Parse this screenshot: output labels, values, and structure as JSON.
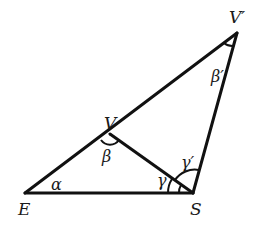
{
  "diagram": {
    "points": {
      "E": {
        "label": "E",
        "x": 25,
        "y": 193
      },
      "S": {
        "label": "S",
        "x": 193,
        "y": 193
      },
      "Vp": {
        "label": "V′",
        "x": 237,
        "y": 33
      },
      "V": {
        "label": "V",
        "x": 110,
        "y": 134
      }
    },
    "angles": {
      "alpha": {
        "label": "α"
      },
      "beta": {
        "label": "β"
      },
      "beta_prime": {
        "label": "β′"
      },
      "gamma": {
        "label": "γ"
      },
      "gamma_prime": {
        "label": "γ′"
      }
    },
    "colors": {
      "stroke": "#111111",
      "background": "#ffffff"
    }
  }
}
